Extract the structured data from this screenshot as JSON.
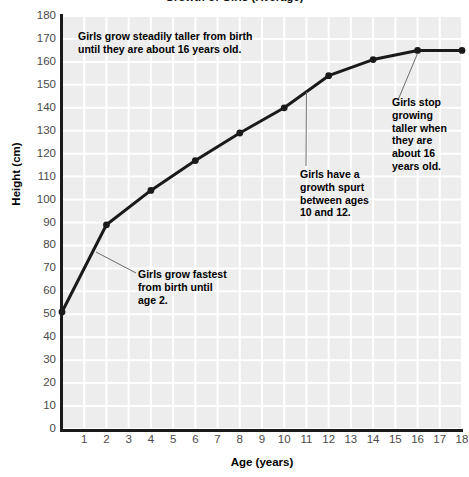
{
  "chart_data": {
    "type": "line",
    "title": "Growth of Girls (Average)",
    "xlabel": "Age (years)",
    "ylabel": "Height (cm)",
    "xlim": [
      0,
      18
    ],
    "ylim": [
      0,
      180
    ],
    "grid": true,
    "legend": "none",
    "x_ticks": [
      1,
      2,
      3,
      4,
      5,
      6,
      7,
      8,
      9,
      10,
      11,
      12,
      13,
      14,
      15,
      16,
      17,
      18
    ],
    "y_ticks": [
      0,
      10,
      20,
      30,
      40,
      50,
      60,
      70,
      80,
      90,
      100,
      110,
      120,
      130,
      140,
      150,
      160,
      170,
      180
    ],
    "series": [
      {
        "name": "Average girl height",
        "x": [
          0,
          2,
          4,
          6,
          8,
          10,
          12,
          14,
          16,
          18
        ],
        "values": [
          51,
          89,
          104,
          117,
          129,
          140,
          154,
          161,
          165,
          165
        ],
        "marker": "circle",
        "color": "#1a1a1a",
        "line_width": 3
      }
    ],
    "annotations": [
      {
        "id": "ann-0",
        "text": "Girls grow steadily taller from birth\nuntil they are about 16 years old.",
        "leader": false
      },
      {
        "id": "ann-1",
        "text": "Girls grow fastest\nfrom birth until\nage 2.",
        "leader": true
      },
      {
        "id": "ann-2",
        "text": "Girls have a\ngrowth spurt\nbetween ages\n10 and 12.",
        "leader": true
      },
      {
        "id": "ann-3",
        "text": "Girls stop\ngrowing\ntaller when\nthey are\nabout 16\nyears old.",
        "leader": true
      }
    ]
  },
  "colors": {
    "plot_background": "#ededed",
    "gridline": "#ffffff",
    "axis": "#1a1a1a",
    "tick_label": "#4a4a4a",
    "line": "#1a1a1a",
    "annotation_text": "#000000",
    "leader_line": "#6b6b6b"
  }
}
